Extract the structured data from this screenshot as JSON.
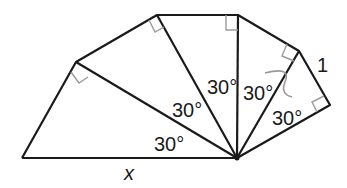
{
  "diagram": {
    "type": "spiral of right triangles (30-60-90)",
    "angle_labels": [
      "30°",
      "30°",
      "30°",
      "30°",
      "30°"
    ],
    "side_label_one": "1",
    "unknown_label": "x",
    "colors": {
      "stroke": "#1a1a1a",
      "right_angle_mark": "#9a9a9a",
      "arc": "#9a9a9a"
    }
  }
}
